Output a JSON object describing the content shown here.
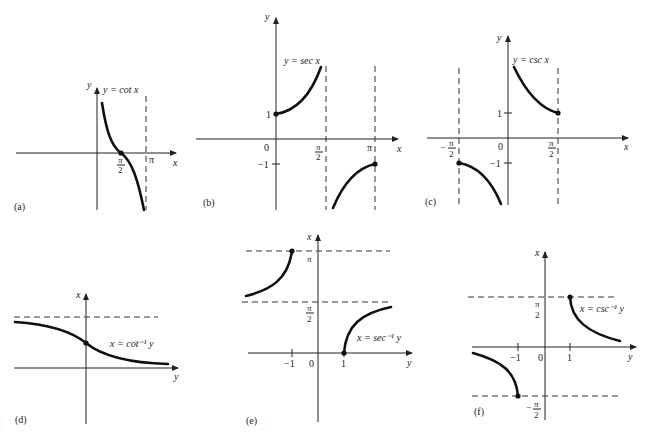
{
  "figure": {
    "panels": [
      {
        "id": "a",
        "panel_label": "(a)",
        "equation": "y = cot x",
        "y_axis_label": "y",
        "x_axis_label": "x",
        "ticks": {
          "pi_over_2_num": "π",
          "pi_over_2_den": "2",
          "pi": "π"
        }
      },
      {
        "id": "b",
        "panel_label": "(b)",
        "equation": "y = sec x",
        "y_axis_label": "y",
        "x_axis_label": "x",
        "ticks": {
          "one": "1",
          "minus_one": "−1",
          "zero": "0",
          "pi_over_2_num": "π",
          "pi_over_2_den": "2",
          "pi": "π"
        }
      },
      {
        "id": "c",
        "panel_label": "(c)",
        "equation": "y = csc x",
        "y_axis_label": "y",
        "x_axis_label": "x",
        "ticks": {
          "one": "1",
          "minus_one": "−1",
          "zero": "0",
          "neg_sign": "−",
          "pi_over_2_num": "π",
          "pi_over_2_den": "2"
        }
      },
      {
        "id": "d",
        "panel_label": "(d)",
        "equation": "x = cot⁻¹ y",
        "y_axis_label": "x",
        "x_axis_label": "y"
      },
      {
        "id": "e",
        "panel_label": "(e)",
        "equation": "x = sec⁻¹ y",
        "y_axis_label": "x",
        "x_axis_label": "y",
        "ticks": {
          "pi": "π",
          "pi_over_2_num": "π",
          "pi_over_2_den": "2",
          "minus_one": "−1",
          "zero": "0",
          "one": "1"
        }
      },
      {
        "id": "f",
        "panel_label": "(f)",
        "equation": "x = csc⁻¹ y",
        "y_axis_label": "x",
        "x_axis_label": "y",
        "ticks": {
          "pi_over_2_num": "π",
          "pi_over_2_den": "2",
          "neg_sign": "−",
          "minus_one": "−1",
          "zero": "0",
          "one": "1"
        }
      }
    ]
  }
}
